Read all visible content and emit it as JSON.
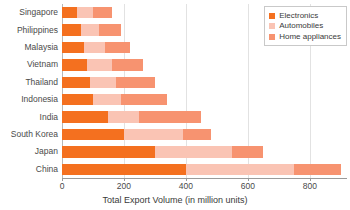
{
  "chart_data": {
    "type": "bar",
    "orientation": "horizontal",
    "stacked": true,
    "title": "",
    "xlabel": "Total Export Volume  (in million units)",
    "ylabel": "",
    "xlim": [
      0,
      920
    ],
    "ylim": null,
    "grid": true,
    "xticks": [
      0,
      200,
      400,
      600,
      800
    ],
    "xtick_labels": [
      "0",
      "200",
      "400",
      "600",
      "800"
    ],
    "legend_position": "upper right",
    "categories": [
      "Singapore",
      "Philippines",
      "Malaysia",
      "Vietnam",
      "Thailand",
      "Indonesia",
      "India",
      "South Korea",
      "Japan",
      "China"
    ],
    "series": [
      {
        "name": "Electronics",
        "color": "#f4701f",
        "values": [
          50,
          60,
          70,
          80,
          90,
          100,
          150,
          200,
          300,
          400
        ]
      },
      {
        "name": "Automobiles",
        "color": "#fac4b4",
        "values": [
          50,
          60,
          70,
          80,
          85,
          90,
          100,
          190,
          250,
          350
        ]
      },
      {
        "name": "Home appliances",
        "color": "#f79370",
        "values": [
          60,
          70,
          80,
          100,
          125,
          150,
          200,
          90,
          100,
          150
        ]
      }
    ],
    "totals": [
      160,
      190,
      220,
      260,
      300,
      340,
      450,
      480,
      650,
      900
    ]
  },
  "axis": {
    "x_title": "Total Export Volume  (in million units)"
  },
  "legend": {
    "entries": [
      {
        "label": "Electronics",
        "color": "#f4701f"
      },
      {
        "label": "Automobiles",
        "color": "#fac4b4"
      },
      {
        "label": "Home appliances",
        "color": "#f79370"
      }
    ]
  }
}
